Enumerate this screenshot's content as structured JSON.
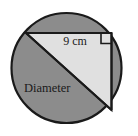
{
  "figure": {
    "name": "circle-with-inscribed-right-triangle",
    "colors": {
      "circle_fill": "#8c8c8c",
      "triangle_fill": "#e0e0e0",
      "stroke": "#1a1a1a",
      "background": "#ffffff"
    },
    "circle": {
      "center_x": 66.5,
      "center_y": 68,
      "radius": 55.5
    },
    "triangle": {
      "vertex_top_left": [
        26,
        33
      ],
      "vertex_top_right": [
        111.5,
        33
      ],
      "vertex_bottom_right": [
        111.5,
        110
      ]
    },
    "right_angle_marker": {
      "x": 101,
      "y": 33,
      "size": 10.5
    },
    "labels": {
      "measure": "9 cm",
      "measure_x": 75,
      "measure_y": 44,
      "diameter": "Diameter",
      "diameter_x": 24,
      "diameter_y": 91
    }
  }
}
